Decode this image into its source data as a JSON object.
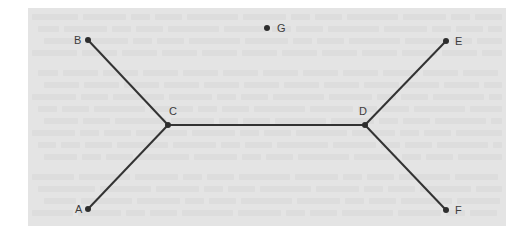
{
  "diagram": {
    "type": "graph",
    "colors": {
      "panel_background": "#e4e4e4",
      "edge": "#333333",
      "node": "#2e2e2e",
      "label": "#3c3c3c"
    },
    "nodes": [
      {
        "id": "A",
        "label": "A",
        "x": 88,
        "y": 209,
        "label_dx": -13,
        "label_dy": 4
      },
      {
        "id": "B",
        "label": "B",
        "x": 88,
        "y": 40,
        "label_dx": -14,
        "label_dy": 4
      },
      {
        "id": "C",
        "label": "C",
        "x": 168,
        "y": 125,
        "label_dx": 1,
        "label_dy": -10
      },
      {
        "id": "D",
        "label": "D",
        "x": 365,
        "y": 125,
        "label_dx": -6,
        "label_dy": -10
      },
      {
        "id": "E",
        "label": "E",
        "x": 446,
        "y": 41,
        "label_dx": 9,
        "label_dy": 4
      },
      {
        "id": "F",
        "label": "F",
        "x": 446,
        "y": 210,
        "label_dx": 9,
        "label_dy": 4
      },
      {
        "id": "G",
        "label": "G",
        "x": 267,
        "y": 28,
        "label_dx": 10,
        "label_dy": 4
      }
    ],
    "edges": [
      {
        "from": "B",
        "to": "C"
      },
      {
        "from": "A",
        "to": "C"
      },
      {
        "from": "C",
        "to": "D"
      },
      {
        "from": "D",
        "to": "E"
      },
      {
        "from": "D",
        "to": "F"
      }
    ],
    "isolated_nodes": [
      "G"
    ]
  }
}
